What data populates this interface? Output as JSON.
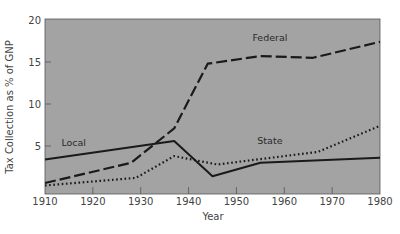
{
  "chart_data": {
    "type": "line",
    "title": "",
    "xlabel": "Year",
    "ylabel": "Tax Collection as % of GNP",
    "xlim": [
      1910,
      1980
    ],
    "ylim": [
      0,
      20
    ],
    "x_ticks": [
      1910,
      1920,
      1930,
      1940,
      1950,
      1960,
      1970,
      1980
    ],
    "y_ticks": [
      5,
      10,
      15,
      20
    ],
    "grid": false,
    "legend": "inline labels",
    "background": "#a3a3a3",
    "series": [
      {
        "name": "Federal",
        "style": "long-dash",
        "points": [
          [
            1910,
            0.6
          ],
          [
            1928,
            3.0
          ],
          [
            1937,
            7.1
          ],
          [
            1944,
            14.8
          ],
          [
            1955,
            15.7
          ],
          [
            1966,
            15.5
          ],
          [
            1980,
            17.4
          ]
        ],
        "label_pos": [
          1957,
          17.5
        ]
      },
      {
        "name": "Local",
        "style": "solid",
        "points": [
          [
            1910,
            3.4
          ],
          [
            1937,
            5.6
          ],
          [
            1945,
            1.4
          ],
          [
            1955,
            3.0
          ],
          [
            1980,
            3.6
          ]
        ],
        "label_pos": [
          1916,
          5.0
        ]
      },
      {
        "name": "State",
        "style": "dotted",
        "points": [
          [
            1910,
            0.3
          ],
          [
            1929,
            1.2
          ],
          [
            1937,
            3.8
          ],
          [
            1946,
            2.8
          ],
          [
            1967,
            4.3
          ],
          [
            1980,
            7.4
          ]
        ],
        "label_pos": [
          1957,
          5.2
        ]
      }
    ]
  }
}
